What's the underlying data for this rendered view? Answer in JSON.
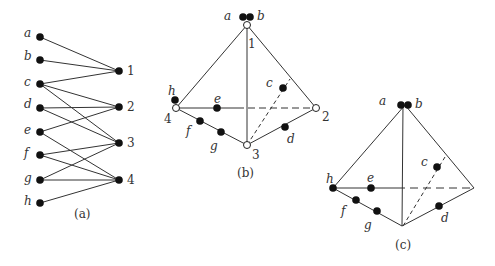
{
  "figure_a": {
    "caption": "(a)",
    "left_labels": [
      "a",
      "b",
      "c",
      "d",
      "e",
      "f",
      "g",
      "h"
    ],
    "right_labels": [
      "1",
      "2",
      "3",
      "4"
    ],
    "edges": [
      [
        "a",
        "1"
      ],
      [
        "b",
        "1"
      ],
      [
        "c",
        "1"
      ],
      [
        "c",
        "2"
      ],
      [
        "c",
        "3"
      ],
      [
        "d",
        "2"
      ],
      [
        "d",
        "3"
      ],
      [
        "e",
        "2"
      ],
      [
        "e",
        "4"
      ],
      [
        "f",
        "3"
      ],
      [
        "f",
        "4"
      ],
      [
        "g",
        "3"
      ],
      [
        "g",
        "4"
      ],
      [
        "h",
        "4"
      ]
    ]
  },
  "figure_b": {
    "caption": "(b)",
    "vertex_labels": {
      "v1": "1",
      "v2": "2",
      "v3": "3",
      "v4": "4"
    },
    "point_labels": {
      "a": "a",
      "b": "b",
      "c": "c",
      "d": "d",
      "e": "e",
      "f": "f",
      "g": "g",
      "h": "h"
    }
  },
  "figure_c": {
    "caption": "(c)",
    "point_labels": {
      "a": "a",
      "b": "b",
      "c": "c",
      "d": "d",
      "e": "e",
      "f": "f",
      "g": "g",
      "h": "h"
    }
  }
}
